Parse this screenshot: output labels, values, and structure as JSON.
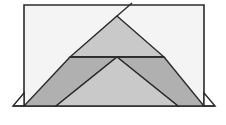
{
  "canvas": {
    "width": 226,
    "height": 125,
    "background": "#ffffff",
    "title": "Geometric triangle figure"
  },
  "palette": {
    "stroke": "#2b2b2b",
    "rect_fill": "#f4f4f4",
    "light_gray": "#c9c9c9",
    "mid_gray": "#b0b0b0",
    "white": "#ffffff",
    "page_background": "#ffffff"
  },
  "geometry": {
    "rect": {
      "x": 24,
      "y": 5,
      "width": 180,
      "height": 101
    },
    "baseline_y": 106,
    "apex": {
      "x": 117,
      "y": 16
    },
    "base_left": {
      "x": 24,
      "y": 106
    },
    "base_right": {
      "x": 204,
      "y": 106
    },
    "mid_line_y": 57,
    "inner_apex": {
      "x": 117,
      "y": 57
    },
    "inner_base_left": {
      "x": 56,
      "y": 106
    },
    "inner_base_right": {
      "x": 178,
      "y": 106
    },
    "mid_left": {
      "x": 70,
      "y": 57
    },
    "mid_right": {
      "x": 164,
      "y": 57
    },
    "corner_tab_left": {
      "x": 13,
      "y": 106
    },
    "corner_tab_right": {
      "x": 215,
      "y": 106
    },
    "corner_tab_top_left": {
      "x": 24,
      "y": 93
    },
    "corner_tab_top_right": {
      "x": 204,
      "y": 93
    },
    "apex_ray_end": {
      "x": 131,
      "y": 4
    }
  },
  "shapes": [
    {
      "id": "outer-rectangle",
      "name": "outer-rectangle",
      "kind": "rect",
      "fill": "#f4f4f4",
      "stroke": "#2b2b2b",
      "stroke_width": 1.6,
      "points": "24,5 204,5 204,106 24,106"
    },
    {
      "id": "upper-triangle",
      "name": "upper-light-triangle",
      "kind": "polygon",
      "fill": "#c9c9c9",
      "stroke": "#2b2b2b",
      "stroke_width": 1.4,
      "points": "117,16 164,57 70,57"
    },
    {
      "id": "left-wing",
      "name": "left-dark-wing",
      "kind": "polygon",
      "fill": "#b0b0b0",
      "stroke": "#2b2b2b",
      "stroke_width": 1.4,
      "points": "70,57 117,57 56,106 24,106"
    },
    {
      "id": "right-wing",
      "name": "right-dark-wing",
      "kind": "polygon",
      "fill": "#b0b0b0",
      "stroke": "#2b2b2b",
      "stroke_width": 1.4,
      "points": "164,57 204,106 178,106 117,57"
    },
    {
      "id": "inner-triangle",
      "name": "inner-light-triangle",
      "kind": "polygon",
      "fill": "#c9c9c9",
      "stroke": "#2b2b2b",
      "stroke_width": 1.4,
      "points": "117,57 178,106 56,106"
    },
    {
      "id": "corner-tab-left",
      "name": "left-corner-white-triangle",
      "kind": "polygon",
      "fill": "#ffffff",
      "stroke": "#2b2b2b",
      "stroke_width": 1.4,
      "points": "13,106 24,93 24,106"
    },
    {
      "id": "corner-tab-right",
      "name": "right-corner-white-triangle",
      "kind": "polygon",
      "fill": "#ffffff",
      "stroke": "#2b2b2b",
      "stroke_width": 1.4,
      "points": "215,106 204,93 204,106"
    }
  ],
  "lines": [
    {
      "id": "apex-ray",
      "name": "apex-extension-ray",
      "x1": 117,
      "y1": 16,
      "x2": 132,
      "y2": 3,
      "stroke": "#2b2b2b",
      "stroke_width": 1.4
    },
    {
      "id": "baseline-extension-left",
      "name": "baseline-extension-left",
      "x1": 13,
      "y1": 106,
      "x2": 24,
      "y2": 106,
      "stroke": "#2b2b2b",
      "stroke_width": 1.4
    },
    {
      "id": "baseline-extension-right",
      "name": "baseline-extension-right",
      "x1": 204,
      "y1": 106,
      "x2": 215,
      "y2": 106,
      "stroke": "#2b2b2b",
      "stroke_width": 1.4
    },
    {
      "id": "mid-horizontal",
      "name": "midline-horizontal",
      "x1": 70,
      "y1": 57,
      "x2": 164,
      "y2": 57,
      "stroke": "#2b2b2b",
      "stroke_width": 1.4
    }
  ],
  "labels": {
    "figure_caption": "",
    "annotations": []
  }
}
